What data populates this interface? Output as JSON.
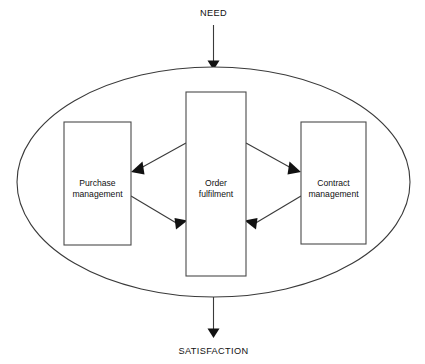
{
  "diagram": {
    "background_color": "#ffffff",
    "line_color": "#3a3a3a",
    "text_color": "#111111",
    "boundary": {
      "shape": "ellipse",
      "name": "system-boundary"
    },
    "input": {
      "label": "NEED",
      "direction": "down"
    },
    "output": {
      "label": "SATISFACTION",
      "direction": "down"
    },
    "boxes": [
      {
        "id": "purchase-management",
        "line1": "Purchase",
        "line2": "management"
      },
      {
        "id": "order-fulfilment",
        "line1": "Order",
        "line2": "fulfilment"
      },
      {
        "id": "contract-management",
        "line1": "Contract",
        "line2": "management"
      }
    ],
    "connectors": [
      {
        "id": "order-to-purchase",
        "from": "order-fulfilment",
        "to": "purchase-management"
      },
      {
        "id": "purchase-to-order",
        "from": "purchase-management",
        "to": "order-fulfilment"
      },
      {
        "id": "order-to-contract",
        "from": "order-fulfilment",
        "to": "contract-management"
      },
      {
        "id": "contract-to-order",
        "from": "contract-management",
        "to": "order-fulfilment"
      }
    ]
  }
}
